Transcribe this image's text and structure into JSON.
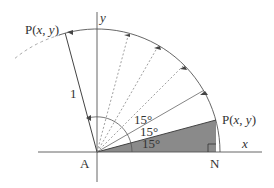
{
  "diagram": {
    "origin_label": "A",
    "foot_label": "N",
    "x_axis_label": "x",
    "y_axis_label": "y",
    "radius_label": "1",
    "point_label_prefix": "P(",
    "point_label_x": "x",
    "point_label_sep": ", ",
    "point_label_y": "y",
    "point_label_suffix": ")",
    "angle_labels": [
      "15°",
      "15°",
      "15°"
    ],
    "step_angle_deg": 15,
    "rotated_angle_deg": 90,
    "colors": {
      "line": "#555555",
      "shade": "#8a8a8a",
      "dotted": "#888888",
      "dashed": "#aaaaaa"
    }
  }
}
